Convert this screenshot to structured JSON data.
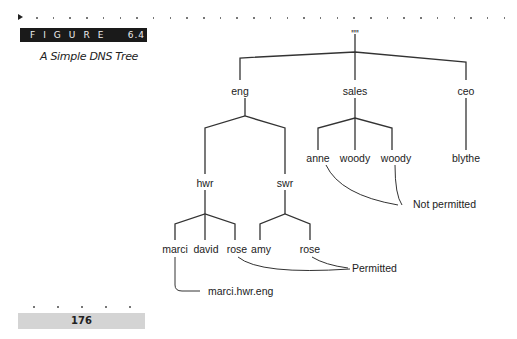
{
  "figure": {
    "label": "FIGURE",
    "number": "6.4",
    "caption": "A Simple DNS Tree"
  },
  "page": {
    "number": "176"
  },
  "tree": {
    "root": "\"\"",
    "level1": [
      "eng",
      "sales",
      "ceo"
    ],
    "eng_children": [
      "hwr",
      "swr"
    ],
    "sales_children": [
      "anne",
      "woody",
      "woody"
    ],
    "ceo_children": [
      "blythe"
    ],
    "hwr_children": [
      "marci",
      "david",
      "rose"
    ],
    "swr_children": [
      "amy",
      "rose"
    ]
  },
  "annotations": {
    "not_permitted": "Not permitted",
    "permitted": "Permitted",
    "fqdn_example": "marci.hwr.eng"
  }
}
